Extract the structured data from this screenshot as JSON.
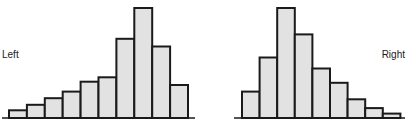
{
  "chart_data": [
    {
      "type": "bar",
      "title": "",
      "label": "Left",
      "description": "Left-skewed histogram",
      "categories": [
        "1",
        "2",
        "3",
        "4",
        "5",
        "6",
        "7",
        "8",
        "9",
        "10"
      ],
      "values": [
        7,
        12,
        18,
        24,
        33,
        37,
        72,
        100,
        65,
        30
      ],
      "xlabel": "",
      "ylabel": "",
      "ylim": [
        0,
        100
      ],
      "grid": false
    },
    {
      "type": "bar",
      "title": "",
      "label": "Right",
      "description": "Right-skewed histogram",
      "categories": [
        "1",
        "2",
        "3",
        "4",
        "5",
        "6",
        "7",
        "8",
        "9"
      ],
      "values": [
        24,
        55,
        100,
        76,
        45,
        32,
        17,
        9,
        4
      ],
      "xlabel": "",
      "ylabel": "",
      "ylim": [
        0,
        100
      ],
      "grid": false
    }
  ]
}
